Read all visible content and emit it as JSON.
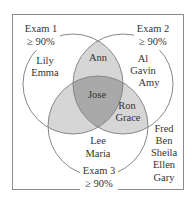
{
  "diagram": {
    "type": "venn",
    "colors": {
      "frame": "#8c8c8c",
      "circle_stroke": "#888888",
      "pair_overlap": "#d6d6d6",
      "triple_overlap": "#a9a9a9",
      "text": "#333333"
    },
    "sets": [
      {
        "name": "Exam 1",
        "line1": "Exam 1",
        "line2": "≥ 90%"
      },
      {
        "name": "Exam 2",
        "line1": "Exam 2",
        "line2": "≥ 90%"
      },
      {
        "name": "Exam 3",
        "line1": "Exam 3",
        "line2": "≥ 90%"
      }
    ],
    "regions": {
      "only_exam1": [
        "Lily",
        "Emma"
      ],
      "only_exam2": [
        "Al",
        "Gavin",
        "Amy"
      ],
      "only_exam3": [
        "Lee",
        "Maria"
      ],
      "exam1_exam2": [
        "Ann"
      ],
      "exam2_exam3": [
        "Ron",
        "Grace"
      ],
      "exam1_exam3": [],
      "all_three": [
        "Jose"
      ],
      "none": [
        "Fred",
        "Ben",
        "Sheila",
        "Ellen",
        "Gary"
      ]
    }
  }
}
